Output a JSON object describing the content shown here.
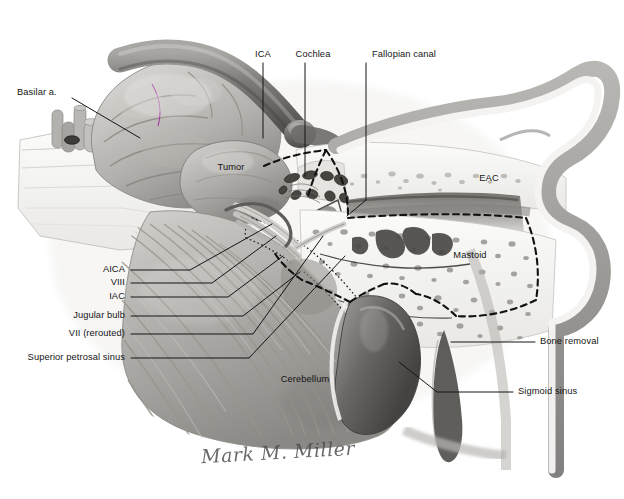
{
  "figure": {
    "kind": "anatomical-illustration",
    "palette": {
      "background": "#ffffff",
      "bone": "#f2f1ee",
      "bone_shadow": "#d8d6d2",
      "soft_tissue": "#9a9a9a",
      "soft_tissue_dark": "#6e6e6e",
      "vessel_dark": "#555555",
      "vessel_mid": "#8c8c8c",
      "brain_light": "#c9c7c4",
      "brain_mid": "#a8a6a3",
      "cerebellum": "#b4b2ae",
      "air_cell": "#6b6b6b",
      "outline": "#1a1a1a",
      "label_text": "#151515",
      "signature": "#4a4a4a"
    },
    "signature": "Mark M. Miller"
  },
  "labels": [
    {
      "id": "basilar-artery",
      "text": "Basilar a.",
      "align": "l",
      "x": 17,
      "y": 93,
      "leader": [
        [
          72,
          98
        ],
        [
          140,
          138
        ]
      ]
    },
    {
      "id": "ica",
      "text": "ICA",
      "align": "c",
      "x": 263,
      "y": 55,
      "leader": [
        [
          263,
          63
        ],
        [
          263,
          138
        ]
      ]
    },
    {
      "id": "cochlea",
      "text": "Cochlea",
      "align": "c",
      "x": 313,
      "y": 55,
      "leader": [
        [
          305,
          63
        ],
        [
          305,
          176
        ]
      ]
    },
    {
      "id": "fallopian-canal",
      "text": "Fallopian canal",
      "align": "c",
      "x": 404,
      "y": 55,
      "leader": [
        [
          366,
          63
        ],
        [
          366,
          200
        ],
        [
          347,
          216
        ]
      ]
    },
    {
      "id": "tumor",
      "text": "Tumor",
      "align": "c",
      "x": 231,
      "y": 168,
      "leader": null
    },
    {
      "id": "eac",
      "text": "EAC",
      "align": "c",
      "x": 489,
      "y": 179,
      "leader": null
    },
    {
      "id": "mastoid",
      "text": "Mastoid",
      "align": "c",
      "x": 470,
      "y": 256,
      "leader": null
    },
    {
      "id": "cerebellum",
      "text": "Cerebellum",
      "align": "c",
      "x": 305,
      "y": 380,
      "leader": null
    },
    {
      "id": "aica",
      "text": "AICA",
      "align": "r",
      "x": 125,
      "y": 270,
      "leader": [
        [
          131,
          270
        ],
        [
          190,
          270
        ],
        [
          272,
          224
        ]
      ]
    },
    {
      "id": "viii",
      "text": "VIII",
      "align": "r",
      "x": 125,
      "y": 283,
      "leader": [
        [
          131,
          283
        ],
        [
          212,
          283
        ],
        [
          276,
          236
        ]
      ]
    },
    {
      "id": "iac",
      "text": "IAC",
      "align": "r",
      "x": 125,
      "y": 297,
      "leader": [
        [
          131,
          297
        ],
        [
          228,
          297
        ],
        [
          283,
          256
        ]
      ]
    },
    {
      "id": "jugular-bulb",
      "text": "Jugular bulb",
      "align": "r",
      "x": 125,
      "y": 316,
      "leader": [
        [
          131,
          316
        ],
        [
          243,
          316
        ],
        [
          300,
          272
        ]
      ]
    },
    {
      "id": "vii-rerouted",
      "text": "VII (rerouted)",
      "align": "r",
      "x": 125,
      "y": 334,
      "leader": [
        [
          131,
          334
        ],
        [
          253,
          334
        ],
        [
          323,
          236
        ]
      ]
    },
    {
      "id": "superior-petrosal-sinus",
      "text": "Superior petrosal sinus",
      "align": "r",
      "x": 125,
      "y": 358,
      "leader": [
        [
          131,
          358
        ],
        [
          249,
          358
        ],
        [
          345,
          256
        ]
      ]
    },
    {
      "id": "bone-removal",
      "text": "Bone removal",
      "align": "l",
      "x": 540,
      "y": 342,
      "leader": [
        [
          535,
          342
        ],
        [
          451,
          342
        ]
      ]
    },
    {
      "id": "sigmoid-sinus",
      "text": "Sigmoid sinus",
      "align": "l",
      "x": 518,
      "y": 392,
      "leader": [
        [
          513,
          392
        ],
        [
          437,
          392
        ],
        [
          399,
          362
        ]
      ]
    }
  ]
}
